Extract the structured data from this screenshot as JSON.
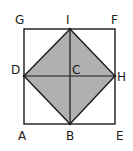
{
  "diagram": {
    "colors": {
      "background": "#ffffff",
      "stroke": "#1a1a1a",
      "fill_shaded": "#b0b0b0"
    },
    "points": {
      "A": {
        "label": "A",
        "x": 24,
        "y": 124
      },
      "B": {
        "label": "B",
        "x": 70,
        "y": 124
      },
      "E": {
        "label": "E",
        "x": 115,
        "y": 124
      },
      "F": {
        "label": "F",
        "x": 115,
        "y": 29
      },
      "G": {
        "label": "G",
        "x": 24,
        "y": 29
      },
      "I": {
        "label": "I",
        "x": 70,
        "y": 29
      },
      "D": {
        "label": "D",
        "x": 24,
        "y": 76
      },
      "H": {
        "label": "H",
        "x": 115,
        "y": 76
      },
      "C": {
        "label": "C",
        "x": 70,
        "y": 76
      }
    },
    "shapes": {
      "outer_square": [
        "A",
        "E",
        "F",
        "G"
      ],
      "shaded_square": [
        "D",
        "I",
        "H",
        "B"
      ],
      "segments": [
        [
          "D",
          "H"
        ],
        [
          "I",
          "B"
        ]
      ]
    },
    "labels": {
      "A": "A",
      "B": "B",
      "C": "C",
      "D": "D",
      "E": "E",
      "F": "F",
      "G": "G",
      "H": "H",
      "I": "I"
    }
  }
}
